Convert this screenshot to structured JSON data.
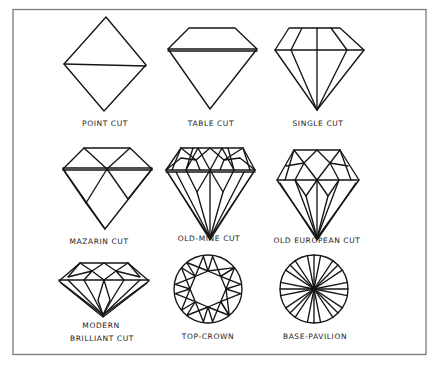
{
  "diagram": {
    "type": "diamond-cut-reference-chart",
    "frame_color": "#7a7a7a",
    "line_color": "#151515",
    "background": "#ffffff",
    "cuts": [
      {
        "id": "point-cut",
        "label": "POINT CUT",
        "row": 1,
        "col": 1
      },
      {
        "id": "table-cut",
        "label": "TABLE CUT",
        "row": 1,
        "col": 2
      },
      {
        "id": "single-cut",
        "label": "SINGLE CUT",
        "row": 1,
        "col": 3
      },
      {
        "id": "mazarin-cut",
        "label": "MAZARIN CUT",
        "row": 2,
        "col": 1
      },
      {
        "id": "old-mine-cut",
        "label": "OLD-MINE CUT",
        "row": 2,
        "col": 2
      },
      {
        "id": "old-european-cut",
        "label": "OLD EUROPEAN CUT",
        "row": 2,
        "col": 3
      },
      {
        "id": "modern-brilliant-cut",
        "label_line1": "MODERN",
        "label_line2": "BRILLIANT CUT",
        "row": 3,
        "col": 1
      },
      {
        "id": "top-crown",
        "label": "TOP-CROWN",
        "row": 3,
        "col": 2
      },
      {
        "id": "base-pavilion",
        "label": "BASE-PAVILION",
        "row": 3,
        "col": 3
      }
    ]
  }
}
